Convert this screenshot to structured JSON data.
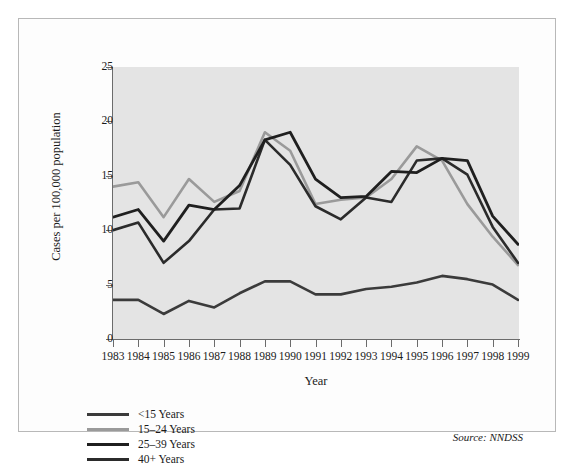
{
  "chart_data": {
    "type": "line",
    "title": "",
    "xlabel": "Year",
    "ylabel": "Cases per 100,000 population",
    "source": "Source: NNDSS",
    "grid": false,
    "legend_position": "below-left",
    "xlim": [
      1983,
      1999
    ],
    "ylim": [
      0,
      25
    ],
    "yticks": [
      0,
      5,
      10,
      15,
      20,
      25
    ],
    "categories": [
      1983,
      1984,
      1985,
      1986,
      1987,
      1988,
      1989,
      1990,
      1991,
      1992,
      1993,
      1994,
      1995,
      1996,
      1997,
      1998,
      1999
    ],
    "xticklabels": [
      "1983",
      "1984",
      "1985",
      "1986",
      "1987",
      "1988",
      "1989",
      "1990",
      "1991",
      "1992",
      "1993",
      "1994",
      "1995",
      "1996",
      "1997",
      "1998",
      "1999"
    ],
    "series": [
      {
        "name": "<15 Years",
        "color": "#3b3b3b",
        "width": 2.6,
        "values": [
          3.6,
          3.6,
          2.3,
          3.5,
          2.9,
          4.2,
          5.3,
          5.3,
          4.1,
          4.1,
          4.6,
          4.8,
          5.2,
          5.8,
          5.5,
          5.0,
          3.6
        ]
      },
      {
        "name": "15–24 Years",
        "color": "#9a9a9a",
        "width": 2.6,
        "values": [
          14.0,
          14.4,
          11.2,
          14.7,
          12.6,
          13.6,
          19.0,
          17.3,
          12.4,
          12.8,
          13.0,
          14.7,
          17.7,
          16.4,
          12.4,
          9.4,
          6.8
        ]
      },
      {
        "name": "25–39 Years",
        "color": "#1f1f1f",
        "width": 2.8,
        "values": [
          11.2,
          11.9,
          9.0,
          12.3,
          11.9,
          14.1,
          18.3,
          19.0,
          14.7,
          13.0,
          13.1,
          15.4,
          15.3,
          16.6,
          16.4,
          11.3,
          8.7
        ]
      },
      {
        "name": "40+ Years",
        "color": "#2b2b2b",
        "width": 2.6,
        "values": [
          10.0,
          10.7,
          7.0,
          9.0,
          11.9,
          12.0,
          18.3,
          16.0,
          12.2,
          11.0,
          13.0,
          12.6,
          16.4,
          16.6,
          15.1,
          10.3,
          7.0
        ]
      }
    ]
  }
}
